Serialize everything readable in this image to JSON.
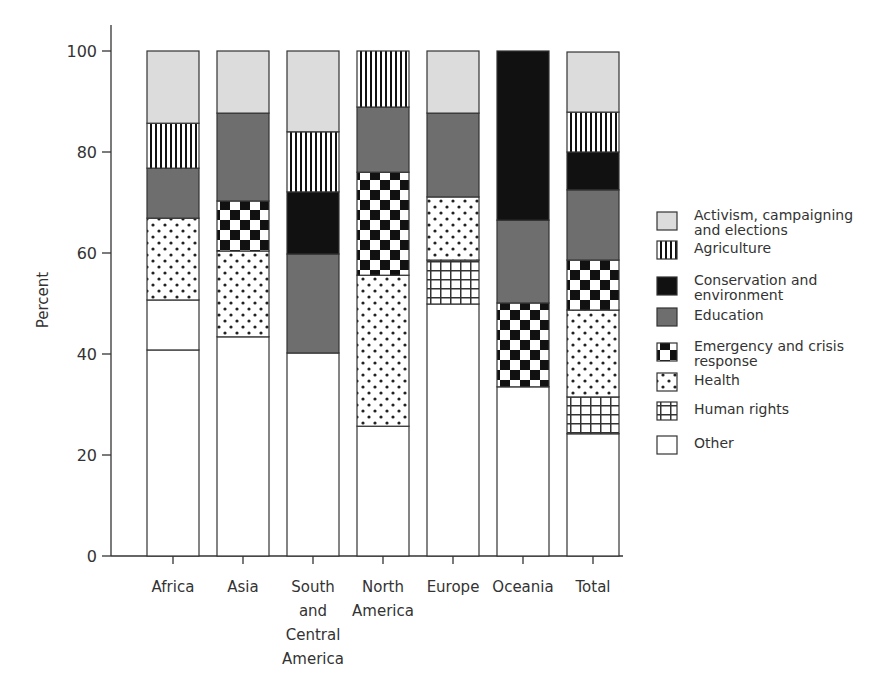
{
  "chart_data": {
    "type": "bar",
    "stacked": true,
    "title": "",
    "xlabel": "",
    "ylabel": "Percent",
    "ylim": [
      0,
      100
    ],
    "yticks": [
      0,
      20,
      40,
      60,
      80,
      100
    ],
    "grid": false,
    "legend_position": "right",
    "categories": [
      "Africa",
      "Asia",
      "South and Central America",
      "North America",
      "Europe",
      "Oceania",
      "Total"
    ],
    "category_label_lines": [
      [
        "Africa"
      ],
      [
        "Asia"
      ],
      [
        "South",
        "and",
        "Central",
        "America"
      ],
      [
        "North",
        "America"
      ],
      [
        "Europe"
      ],
      [
        "Oceania"
      ],
      [
        "Total"
      ]
    ],
    "series": [
      {
        "name": "Other",
        "pattern": "white",
        "values": [
          40.8,
          43.4,
          40.2,
          25.7,
          49.9,
          33.5,
          24.2
        ]
      },
      {
        "name": "Human rights",
        "pattern": "grid",
        "values": [
          9.9,
          0,
          0,
          0,
          8.7,
          0,
          7.3
        ]
      },
      {
        "name": "Health",
        "pattern": "dots",
        "values": [
          16.2,
          17.0,
          0,
          29.9,
          12.5,
          0,
          17.2
        ]
      },
      {
        "name": "Emergency and crisis response",
        "pattern": "checker",
        "values": [
          0,
          9.9,
          0,
          20.4,
          0,
          16.6,
          9.9
        ]
      },
      {
        "name": "Education",
        "pattern": "darkgray",
        "values": [
          9.9,
          17.4,
          19.6,
          12.9,
          16.6,
          16.4,
          13.9
        ]
      },
      {
        "name": "Conservation and environment",
        "pattern": "black",
        "values": [
          0,
          0,
          12.3,
          0,
          0,
          33.5,
          7.5
        ]
      },
      {
        "name": "Agriculture",
        "pattern": "vlines",
        "values": [
          8.9,
          0,
          11.9,
          11.1,
          0,
          0,
          7.9
        ]
      },
      {
        "name": "Activism, campaigning and elections",
        "pattern": "lightgray",
        "values": [
          14.3,
          12.3,
          16.0,
          0,
          12.3,
          0,
          11.9
        ]
      }
    ]
  },
  "legend": {
    "items": [
      {
        "pattern": "lightgray",
        "lines": [
          "Activism, campaigning",
          "and elections"
        ]
      },
      {
        "pattern": "vlines",
        "lines": [
          "Agriculture"
        ]
      },
      {
        "pattern": "black",
        "lines": [
          "Conservation and",
          "environment"
        ]
      },
      {
        "pattern": "darkgray",
        "lines": [
          "Education"
        ]
      },
      {
        "pattern": "checker",
        "lines": [
          "Emergency and crisis",
          "response"
        ]
      },
      {
        "pattern": "dots",
        "lines": [
          "Health"
        ]
      },
      {
        "pattern": "grid",
        "lines": [
          "Human rights"
        ]
      },
      {
        "pattern": "white",
        "lines": [
          "Other"
        ]
      }
    ]
  },
  "colors": {
    "axis": "#333333",
    "lightgray": "#dcdcdc",
    "darkgray": "#6e6e6e",
    "black": "#111111",
    "white": "#ffffff"
  },
  "segment_overrides": [
    {
      "category_index": 0,
      "series": "Human rights",
      "pattern": "white"
    }
  ]
}
